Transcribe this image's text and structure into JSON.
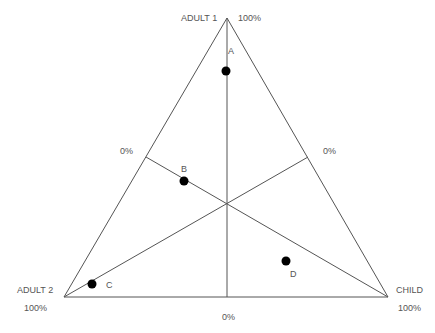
{
  "diagram": {
    "type": "ternary-triangle",
    "vertices": {
      "top": {
        "label": "ADULT 1",
        "value": "100%"
      },
      "left": {
        "label": "ADULT 2",
        "value": "100%"
      },
      "right": {
        "label": "CHILD",
        "value": "100%"
      }
    },
    "midpoint_labels": {
      "left_side": "0%",
      "right_side": "0%",
      "base": "0%"
    },
    "points": [
      {
        "label": "A",
        "x": 226,
        "y": 71
      },
      {
        "label": "B",
        "x": 184,
        "y": 181
      },
      {
        "label": "C",
        "x": 92,
        "y": 284
      },
      {
        "label": "D",
        "x": 286,
        "y": 261
      }
    ],
    "colors": {
      "line": "#555555",
      "point": "#000000",
      "text": "#555555"
    }
  }
}
